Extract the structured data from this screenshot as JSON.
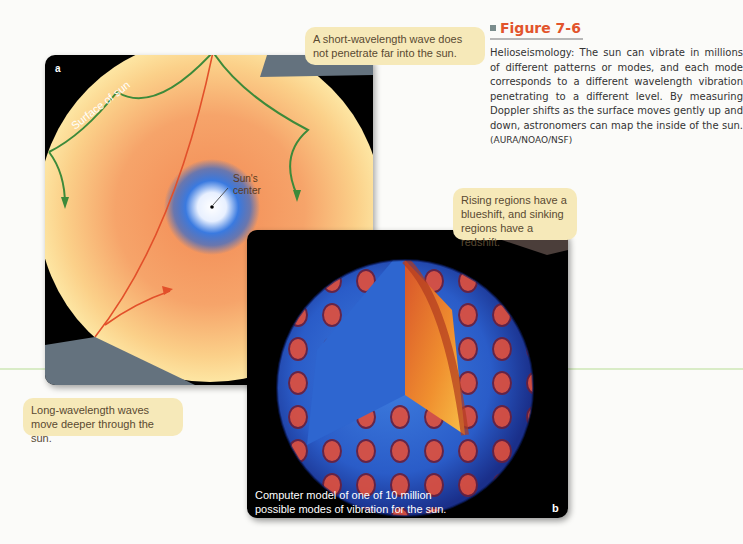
{
  "figure": {
    "number": "Figure 7-6",
    "caption": "Helioseismology: The sun can vibrate in millions of different patterns or modes, and each mode corresponds to a different wavelength vibration penetrating to a different level. By measuring Doppler shifts as the surface moves gently up and down, astronomers can map the inside of the sun.",
    "credit": "(AURA/NOAO/NSF)"
  },
  "panel_a": {
    "label": "a",
    "surface_label": "Surface of sun",
    "center_label_line1": "Sun's",
    "center_label_line2": "center"
  },
  "panel_b": {
    "label": "b",
    "caption_line1": "Computer model of one of 10 million",
    "caption_line2": "possible modes of vibration for the sun."
  },
  "callouts": {
    "short_wave": "A short-wavelength wave does not penetrate far into the sun.",
    "long_wave": "Long-wavelength waves move deeper through the sun.",
    "shift": "Rising regions have a blueshift, and sinking regions have a redshift."
  },
  "colors": {
    "title_accent": "#e2542c",
    "callout_bg": "#f6e9b9",
    "wave_short": "#3d8a3a",
    "wave_long": "#e2502a"
  }
}
